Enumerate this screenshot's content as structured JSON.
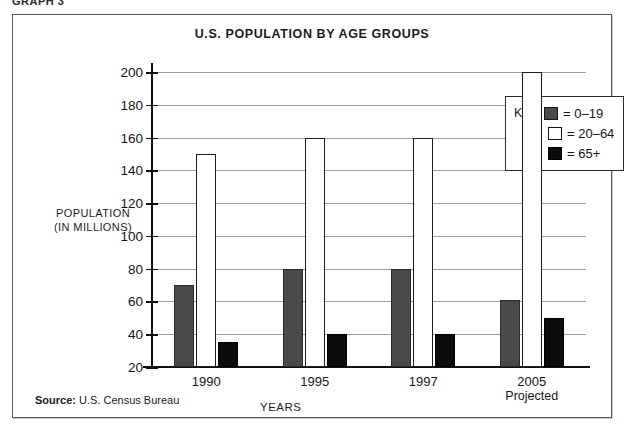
{
  "caption": "GRAPH 3",
  "source": {
    "prefix": "Source:",
    "text": " U.S. Census Bureau"
  },
  "legend": {
    "label": "Key:",
    "entries": [
      {
        "text": "= 0–19",
        "swatch": "gray-swatch-icon"
      },
      {
        "text": "= 20–64",
        "swatch": "white-swatch-icon"
      },
      {
        "text": "= 65+",
        "swatch": "black-swatch-icon"
      }
    ]
  },
  "chart_data": {
    "type": "bar",
    "title": "U.S. POPULATION BY AGE GROUPS",
    "xlabel": "YEARS",
    "ylabel": "POPULATION\n(IN MILLIONS)",
    "ylabel_line1": "POPULATION",
    "ylabel_line2": "(IN MILLIONS)",
    "categories": [
      "1990",
      "1995",
      "1997",
      "2005"
    ],
    "category_sublabels": [
      "",
      "",
      "",
      "Projected"
    ],
    "series": [
      {
        "name": "0–19",
        "color": "#4a4a4a",
        "values": [
          70,
          80,
          80,
          61
        ]
      },
      {
        "name": "20–64",
        "color": "#ffffff",
        "values": [
          150,
          160,
          160,
          200
        ]
      },
      {
        "name": "65+",
        "color": "#0c0c0c",
        "values": [
          35,
          40,
          40,
          50
        ]
      }
    ],
    "ylim": [
      20,
      200
    ],
    "yticks": [
      20,
      40,
      60,
      80,
      100,
      120,
      140,
      160,
      180,
      200
    ],
    "grid": true,
    "legend_position": "top-right"
  }
}
